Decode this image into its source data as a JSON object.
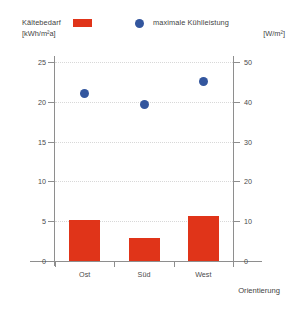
{
  "legend": {
    "left": {
      "label": "Kältebedarf",
      "unit": "[kWh/m²a]",
      "marker": "bar-swatch",
      "color": "#e03419"
    },
    "right": {
      "label": "maximale Kühlleistung",
      "unit": "[W/m²]",
      "marker": "dot-swatch",
      "color": "#33569e"
    }
  },
  "axes": {
    "left_ticks": [
      "25",
      "20",
      "15",
      "10",
      "5",
      "0"
    ],
    "right_ticks": [
      "50",
      "40",
      "30",
      "20",
      "10",
      "0"
    ],
    "x_title": "Orientierung",
    "categories": [
      "Ost",
      "Süd",
      "West"
    ]
  },
  "chart_data": {
    "type": "bar",
    "title": "",
    "subtitle": "",
    "xlabel": "Orientierung",
    "ylabel": "",
    "categories": [
      "Ost",
      "Süd",
      "West"
    ],
    "grid": true,
    "legend_position": "top",
    "series": [
      {
        "name": "Kältebedarf",
        "unit": "[kWh/m²a]",
        "type": "bar",
        "axis": "left",
        "color": "#e03419",
        "values": [
          5.1,
          2.9,
          5.7
        ]
      },
      {
        "name": "maximale Kühlleistung",
        "unit": "[W/m²]",
        "type": "scatter",
        "axis": "right",
        "color": "#33569e",
        "values": [
          42.0,
          39.2,
          45.2
        ]
      }
    ],
    "ylim_left": [
      0,
      25
    ],
    "ylim_right": [
      0,
      50
    ],
    "yticks_left": [
      0,
      5,
      10,
      15,
      20,
      25
    ],
    "yticks_right": [
      0,
      10,
      20,
      30,
      40,
      50
    ]
  }
}
